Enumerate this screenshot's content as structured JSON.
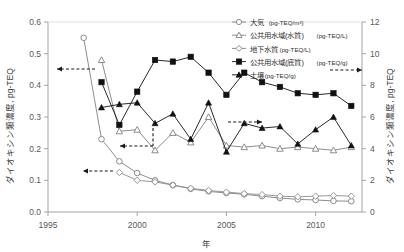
{
  "chart_data": {
    "type": "line",
    "title": "",
    "xlabel": "年",
    "ylabel_left": "ダイオキシン類濃度, pg-TEQ",
    "ylabel_right": "ダイオキシン類濃度, pg-TEQ",
    "xlim": [
      1995,
      2012.6
    ],
    "xticks": [
      1995,
      2000,
      2005,
      2010
    ],
    "xtick_labels": [
      "1995",
      "2000",
      "2005",
      "2010"
    ],
    "ylim_left": [
      0.0,
      0.6
    ],
    "yticks_left": [
      0.0,
      0.1,
      0.2,
      0.3,
      0.4,
      0.5,
      0.6
    ],
    "ytick_labels_left": [
      "0.0",
      "0.1",
      "0.2",
      "0.3",
      "0.4",
      "0.5",
      "0.6"
    ],
    "ylim_right": [
      0,
      12
    ],
    "yticks_right": [
      0,
      2,
      4,
      6,
      8,
      10,
      12
    ],
    "ytick_labels_right": [
      "0",
      "2",
      "4",
      "6",
      "8",
      "10",
      "12"
    ],
    "grid": false,
    "legend_position": "top-right",
    "series": [
      {
        "name": "大気",
        "unit": "(pg-TEQ/m³)",
        "axis": "left",
        "marker": "circle-open",
        "color": "#808080",
        "x": [
          1997,
          1998,
          1999,
          2000,
          2001,
          2002,
          2003,
          2004,
          2005,
          2006,
          2007,
          2008,
          2009,
          2010,
          2011,
          2012
        ],
        "y": [
          0.55,
          0.23,
          0.16,
          0.123,
          0.1,
          0.085,
          0.073,
          0.065,
          0.06,
          0.056,
          0.05,
          0.044,
          0.04,
          0.038,
          0.035,
          0.034
        ]
      },
      {
        "name": "公共用水域(水質)",
        "unit": "(pg-TEQ/L)",
        "axis": "left",
        "marker": "triangle-open",
        "color": "#7f7f7f",
        "x": [
          1998,
          1999,
          2000,
          2001,
          2002,
          2003,
          2004,
          2005,
          2006,
          2007,
          2008,
          2009,
          2010,
          2011,
          2012
        ],
        "y": [
          0.48,
          0.255,
          0.26,
          0.195,
          0.25,
          0.22,
          0.3,
          0.21,
          0.205,
          0.21,
          0.2,
          0.205,
          0.2,
          0.195,
          0.205
        ]
      },
      {
        "name": "地下水質",
        "unit": "(pg-TEQ/L)",
        "axis": "left",
        "marker": "diamond-open",
        "color": "#8c8c8c",
        "x": [
          1999,
          2000,
          2001,
          2002,
          2003,
          2004,
          2005,
          2006,
          2007,
          2008,
          2009,
          2010,
          2011,
          2012
        ],
        "y": [
          0.125,
          0.1,
          0.095,
          0.085,
          0.075,
          0.068,
          0.063,
          0.058,
          0.055,
          0.05,
          0.048,
          0.05,
          0.052,
          0.05
        ]
      },
      {
        "name": "公共用水域(底質)",
        "unit": "(pg-TEQ/g)",
        "axis": "right",
        "marker": "square-filled",
        "color": "#111111",
        "x": [
          1998,
          1999,
          2000,
          2001,
          2002,
          2003,
          2004,
          2005,
          2006,
          2007,
          2008,
          2009,
          2010,
          2011,
          2012
        ],
        "y": [
          8.2,
          5.5,
          7.6,
          9.6,
          9.5,
          9.8,
          8.8,
          7.4,
          8.8,
          8.2,
          7.9,
          7.5,
          7.4,
          7.5,
          6.7
        ]
      },
      {
        "name": "土壌",
        "unit": "(pg-TEQ/g)",
        "axis": "right",
        "marker": "triangle-filled",
        "color": "#111111",
        "x": [
          1998,
          1999,
          2000,
          2001,
          2002,
          2003,
          2004,
          2005,
          2006,
          2007,
          2008,
          2009,
          2010,
          2011,
          2012
        ],
        "y": [
          6.6,
          6.8,
          6.9,
          5.6,
          6.2,
          4.6,
          6.9,
          3.8,
          5.6,
          5.3,
          5.4,
          4.3,
          5.2,
          6.0,
          4.2
        ]
      }
    ],
    "annotations": [
      {
        "name": "arrow-to-left-axis-upper",
        "type": "arrow-left",
        "from_x": 95,
        "from_y": 69,
        "to_x": 57,
        "to_y": 69
      },
      {
        "name": "arrow-to-left-axis-lower",
        "type": "arrow-left",
        "from_x": 113,
        "from_y": 171,
        "to_x": 83,
        "to_y": 171
      },
      {
        "name": "arrow-to-left-axis-mid",
        "type": "arrow-left-elbow",
        "from_x": 153,
        "from_y": 128,
        "to_x": 120,
        "to_y": 146
      },
      {
        "name": "arrow-to-right-axis-upper",
        "type": "arrow-right",
        "from_x": 330,
        "from_y": 70,
        "to_x": 362,
        "to_y": 70
      },
      {
        "name": "arrow-to-right-axis-mid",
        "type": "arrow-right",
        "from_x": 228,
        "from_y": 122,
        "to_x": 262,
        "to_y": 122
      }
    ]
  },
  "legend": {
    "items": [
      {
        "label": "大気",
        "unit": "(pg-TEQ/m³)",
        "marker": "circle-open"
      },
      {
        "label": "公共用水域(水質)",
        "unit": "(pg-TEQ/L)",
        "marker": "triangle-open"
      },
      {
        "label": "地下水質",
        "unit": "(pg-TEQ/L)",
        "marker": "diamond-open"
      },
      {
        "label": "公共用水域(底質)",
        "unit": "(pg-TEQ/g)",
        "marker": "square-filled"
      },
      {
        "label": "土壌",
        "unit": "(pg-TEQ/g)",
        "marker": "triangle-filled"
      }
    ]
  }
}
